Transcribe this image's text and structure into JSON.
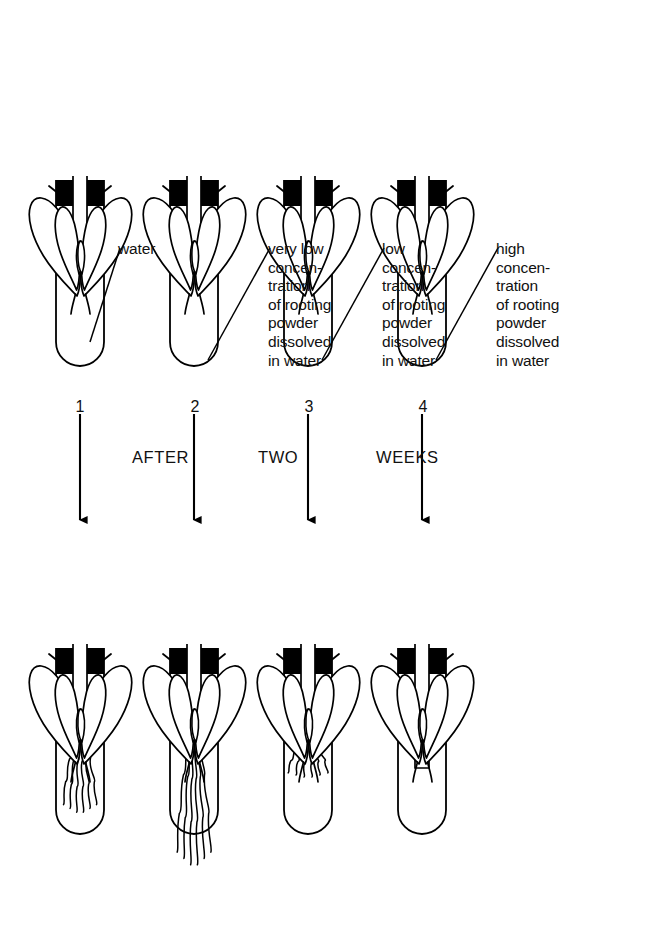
{
  "figure": {
    "stage_caption_words": [
      "AFTER",
      "TWO",
      "WEEKS"
    ],
    "ink_color": "#000000",
    "background_color": "#ffffff",
    "stopper_color": "#000000"
  },
  "stage_labels": [
    {
      "word": "AFTER",
      "x": 132,
      "y": 448
    },
    {
      "word": "TWO",
      "x": 258,
      "y": 448
    },
    {
      "word": "WEEKS",
      "x": 376,
      "y": 448
    }
  ],
  "tubes": [
    {
      "number": "1",
      "label": "water",
      "label_lines": [
        "water"
      ],
      "condition": "water",
      "concentration": "none",
      "before_roots": "none",
      "after_roots": "medium",
      "after_root_count": 6,
      "after_root_length_px": 78
    },
    {
      "number": "2",
      "label": "very low\nconcen-\ntration\nof rooting\npowder\ndissolved\nin water",
      "label_lines": [
        "very low",
        "concen-",
        "tration",
        "of rooting",
        "powder",
        "dissolved",
        "in water"
      ],
      "condition": "very low concentration of rooting powder dissolved in water",
      "concentration": "very low",
      "before_roots": "none",
      "after_roots": "long",
      "after_root_count": 6,
      "after_root_length_px": 132
    },
    {
      "number": "3",
      "label": "low\nconcen-\ntration\nof rooting\npowder\ndissolved\nin water",
      "label_lines": [
        "low",
        "concen-",
        "tration",
        "of rooting",
        "powder",
        "dissolved",
        "in water"
      ],
      "condition": "low concentration of rooting powder dissolved in water",
      "concentration": "low",
      "before_roots": "none",
      "after_roots": "short",
      "after_root_count": 6,
      "after_root_length_px": 42
    },
    {
      "number": "4",
      "label": "high\nconcen-\ntration\nof rooting\npowder\ndissolved\nin water",
      "label_lines": [
        "high",
        "concen-",
        "tration",
        "of rooting",
        "powder",
        "dissolved",
        "in water"
      ],
      "condition": "high concentration of rooting powder dissolved in water",
      "concentration": "high",
      "before_roots": "none",
      "after_roots": "none",
      "after_root_count": 0,
      "after_root_length_px": 0
    }
  ],
  "label_positions": [
    {
      "x": 118,
      "y": 240
    },
    {
      "x": 268,
      "y": 240
    },
    {
      "x": 382,
      "y": 240
    },
    {
      "x": 496,
      "y": 240
    }
  ],
  "tube_number_positions": [
    {
      "x": 65,
      "y": 398
    },
    {
      "x": 180,
      "y": 398
    },
    {
      "x": 294,
      "y": 398
    },
    {
      "x": 408,
      "y": 398
    }
  ]
}
